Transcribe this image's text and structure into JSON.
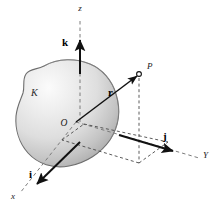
{
  "figure": {
    "type": "vector-diagram-3d",
    "background_color": "#ffffff",
    "axes": [
      {
        "id": "z",
        "label": "z",
        "label_x": 80,
        "label_y": 11,
        "style": "dashed",
        "direction": "up"
      },
      {
        "id": "y",
        "label": "Y",
        "label_x": 203,
        "label_y": 158,
        "style": "dashed",
        "direction": "right-down"
      },
      {
        "id": "x",
        "label": "x",
        "label_x": 11,
        "label_y": 199,
        "style": "dashed",
        "direction": "left-down"
      }
    ],
    "origin": {
      "label": "O",
      "label_x": 64,
      "label_y": 126,
      "x": 76,
      "y": 122
    },
    "unit_vectors": [
      {
        "id": "k",
        "label": "k",
        "label_x": 62,
        "label_y": 46,
        "color": "#111111",
        "direction": "up",
        "tail_x": 80,
        "tail_y": 72,
        "tip_x": 80,
        "tip_y": 36
      },
      {
        "id": "j",
        "label": "j",
        "label_x": 163,
        "label_y": 140,
        "color": "#111111",
        "direction": "right-down",
        "tail_x": 119,
        "tail_y": 135,
        "tip_x": 176,
        "tip_y": 152
      },
      {
        "id": "i",
        "label": "i",
        "label_x": 29,
        "label_y": 178,
        "color": "#111111",
        "direction": "left-down",
        "tail_x": 80,
        "tail_y": 142,
        "tip_x": 34,
        "tip_y": 187
      }
    ],
    "position_vector": {
      "id": "r",
      "label": "r",
      "label_x": 108,
      "label_y": 96,
      "color": "#111111",
      "tail_x": 76,
      "tail_y": 122,
      "tip_x": 139,
      "tip_y": 74
    },
    "point": {
      "label": "P",
      "label_x": 147,
      "label_y": 69,
      "x": 139,
      "y": 74,
      "marker": "open-circle"
    },
    "region": {
      "label": "K",
      "label_x": 31,
      "label_y": 96,
      "fill_light": "#f2f2f2",
      "fill_mid": "#dcdcdc",
      "fill_dark": "#a8a8a8",
      "stroke": "#6e6e6e"
    },
    "projection": {
      "style": "dashed",
      "color": "#4a4a4a",
      "description": "Dashed projection lines from P down to the XY plane forming a parallelogram"
    }
  }
}
